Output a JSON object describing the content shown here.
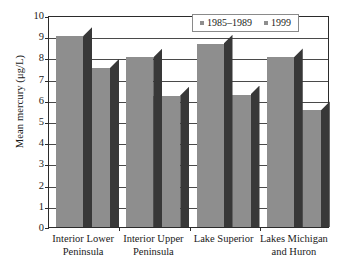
{
  "chart_data": {
    "type": "bar",
    "title": "",
    "xlabel": "",
    "ylabel": "Mean mercury (μg/L)",
    "ylim": [
      0,
      10
    ],
    "ytick_step": 1,
    "yticks": [
      "10",
      "9",
      "8",
      "7",
      "6",
      "5",
      "4",
      "3",
      "2",
      "1",
      "0"
    ],
    "grid": true,
    "legend_position": "top-right-inside",
    "categories": [
      "Interior Lower Peninsula",
      "Interior Upper Peninsula",
      "Lake Superior",
      "Lakes Michigan and Huron"
    ],
    "category_lines": [
      [
        "Interior Lower",
        "Peninsula"
      ],
      [
        "Interior Upper",
        "Peninsula"
      ],
      [
        "Lake Superior",
        ""
      ],
      [
        "Lakes Michigan",
        "and Huron"
      ]
    ],
    "series": [
      {
        "name": "1985–1989",
        "color": "#8e8e8e",
        "values": [
          9.0,
          8.0,
          8.65,
          8.0
        ]
      },
      {
        "name": "1999",
        "color": "#8e8e8e",
        "values": [
          7.5,
          6.2,
          6.25,
          5.5
        ]
      }
    ]
  },
  "legend": {
    "items": [
      {
        "label": "1985–1989",
        "swatch": "#8e8e8e"
      },
      {
        "label": "1999",
        "swatch": "#8e8e8e"
      }
    ]
  },
  "axis": {
    "y_title": "Mean mercury (μg/L)"
  }
}
